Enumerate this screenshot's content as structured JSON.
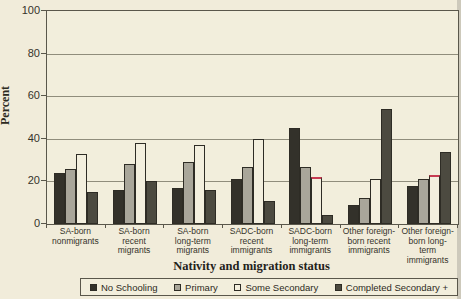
{
  "chart_data": {
    "type": "bar",
    "title": "",
    "xlabel": "Nativity and migration status",
    "ylabel": "Percent",
    "ylim": [
      0,
      100
    ],
    "yticks": [
      0,
      20,
      40,
      60,
      80,
      100
    ],
    "grid": "horizontal",
    "legend_position": "bottom",
    "categories": [
      "SA-born nonmigrants",
      "SA-born recent migrants",
      "SA-born long-term migrants",
      "SADC-born recent immigrants",
      "SADC-born long-term immigrants",
      "Other foreign-born recent immigrants",
      "Other foreign-born long-term immigrants"
    ],
    "category_label_lines": [
      [
        "SA-born",
        "nonmigrants"
      ],
      [
        "SA-born",
        "recent",
        "migrants"
      ],
      [
        "SA-born",
        "long-term",
        "migrants"
      ],
      [
        "SADC-born",
        "recent",
        "immigrants"
      ],
      [
        "SADC-born",
        "long-term",
        "immigrants"
      ],
      [
        "Other foreign-",
        "born recent",
        "immigrants"
      ],
      [
        "Other foreign-",
        "born long-",
        "term",
        "immigrants"
      ]
    ],
    "series": [
      {
        "name": "No Schooling",
        "color": "#33312a",
        "values": [
          24,
          16,
          17,
          21,
          45,
          9,
          18
        ]
      },
      {
        "name": "Primary",
        "color": "#a9a69a",
        "values": [
          26,
          28,
          29,
          27,
          27,
          12,
          21
        ]
      },
      {
        "name": "Some Secondary",
        "color": "#f3efde",
        "values": [
          33,
          38,
          37,
          40,
          22,
          21,
          23
        ],
        "top_highlight": [
          false,
          false,
          false,
          false,
          true,
          false,
          true
        ],
        "highlight_color": "#c73b52"
      },
      {
        "name": "Completed Secondary +",
        "color": "#4c4a40",
        "values": [
          15,
          20,
          16,
          11,
          4,
          54,
          34
        ]
      }
    ]
  },
  "colors": {
    "background": "#f1ecda",
    "axis": "#5a574b",
    "gridline": "#908d7c",
    "bar_outline": "#2e2c25",
    "text": "#2c2a22"
  }
}
